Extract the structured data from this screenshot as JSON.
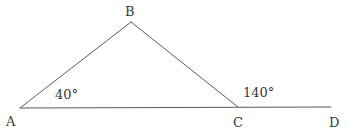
{
  "figure": {
    "background_color": "#ffffff",
    "stroke_color": "#555b5e",
    "text_color": "#3a3a3a",
    "width": 348,
    "height": 131
  },
  "vertices": {
    "a": {
      "label": "A",
      "x": 20,
      "y": 108,
      "label_x": 6,
      "label_y": 126
    },
    "b": {
      "label": "B",
      "x": 131,
      "y": 22,
      "label_x": 125,
      "label_y": 16
    },
    "c": {
      "label": "C",
      "x": 238,
      "y": 107,
      "label_x": 233,
      "label_y": 127
    },
    "d": {
      "label": "D",
      "x": 331,
      "y": 107,
      "label_x": 329,
      "label_y": 127
    }
  },
  "angles": {
    "interior_a": {
      "label": "40°",
      "value": 40,
      "x": 55,
      "y": 99
    },
    "exterior_c": {
      "label": "140°",
      "value": 140,
      "x": 243,
      "y": 97
    }
  },
  "segments": {
    "ab": "M 20 108 L 131 22",
    "bc": "M 131 22 L 238 107",
    "ad": "M 20 108 L 331 107"
  }
}
